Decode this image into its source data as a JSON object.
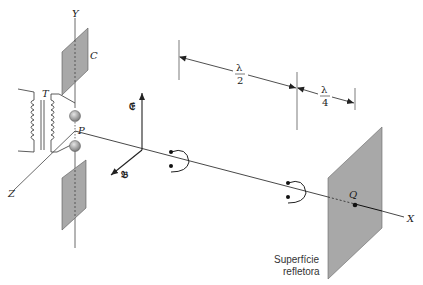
{
  "diagram": {
    "labels": {
      "y_axis": "Y",
      "z_axis": "Z",
      "x_axis": "X",
      "capacitor_plate": "C",
      "transformer": "T",
      "point_p": "P",
      "point_q": "Q",
      "electric_field": "𝔈",
      "magnetic_field": "𝔅",
      "half_wavelength_num": "λ",
      "half_wavelength_den": "2",
      "quarter_wavelength_num": "λ",
      "quarter_wavelength_den": "4",
      "reflecting_surface_line1": "Superfície",
      "reflecting_surface_line2": "refletora"
    },
    "colors": {
      "plate_fill": "#a8a8a8",
      "line": "#222222",
      "sphere": "#9a9a9a"
    }
  }
}
